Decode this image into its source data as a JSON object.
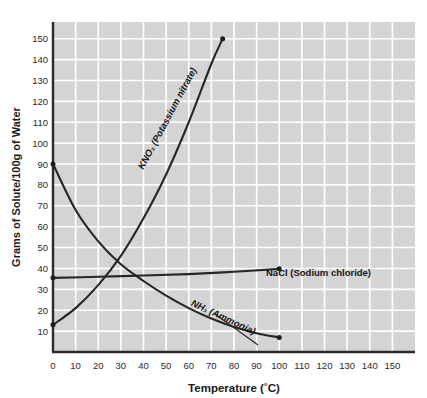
{
  "chart_data": {
    "type": "line",
    "title": "",
    "xlabel": "Temperature (˚C)",
    "ylabel": "Grams of Solute/100g of Water",
    "xlim": [
      0,
      160
    ],
    "ylim": [
      0,
      158
    ],
    "xticks": [
      0,
      10,
      20,
      30,
      40,
      50,
      60,
      70,
      80,
      90,
      100,
      110,
      120,
      130,
      140,
      150
    ],
    "yticks": [
      10,
      20,
      30,
      40,
      50,
      60,
      70,
      80,
      90,
      100,
      110,
      120,
      130,
      140,
      150
    ],
    "grid": true,
    "legend_position": "inline-labels",
    "plot_background": "#d4d4d4",
    "grid_color": "#ffffff",
    "line_color": "#262626",
    "series": [
      {
        "name": "KNO3 (Potassium nitrate)",
        "label_html": "KNO₃ (Potassium nitrate)",
        "label_rotation": -62,
        "x": [
          0,
          10,
          20,
          30,
          40,
          50,
          60,
          70,
          75
        ],
        "values": [
          13,
          21,
          32,
          46,
          64,
          85,
          110,
          138,
          150
        ]
      },
      {
        "name": "NaCl (Sodium chloride)",
        "label_html": "NaCl (Sodium chloride)",
        "label_rotation": 0,
        "x": [
          0,
          20,
          40,
          60,
          80,
          100
        ],
        "values": [
          35.5,
          36,
          36.6,
          37.3,
          38.4,
          39.8
        ]
      },
      {
        "name": "NH3 (Ammonia)",
        "label_html": "NH₃ (Ammonia)",
        "label_rotation": 25,
        "x": [
          0,
          10,
          20,
          30,
          40,
          50,
          60,
          70,
          80,
          90,
          100
        ],
        "values": [
          90,
          68,
          53,
          42,
          34,
          27,
          21,
          16,
          12,
          9,
          7
        ]
      }
    ]
  },
  "axes": {
    "y_title": "Grams of Solute/100g of Water",
    "x_title": "Temperature (˚C)",
    "x_tick_labels": [
      "0",
      "10",
      "20",
      "30",
      "40",
      "50",
      "60",
      "70",
      "80",
      "90",
      "100",
      "110",
      "120",
      "130",
      "140",
      "150"
    ],
    "y_tick_labels": [
      "10",
      "20",
      "30",
      "40",
      "50",
      "60",
      "70",
      "80",
      "90",
      "100",
      "110",
      "120",
      "130",
      "140",
      "150"
    ]
  },
  "annotations": {
    "kno3": "KNO₃ (Potassium nitrate)",
    "nacl": "NaCl (Sodium chloride)",
    "nh3": "NH₃ (Ammonia)"
  }
}
